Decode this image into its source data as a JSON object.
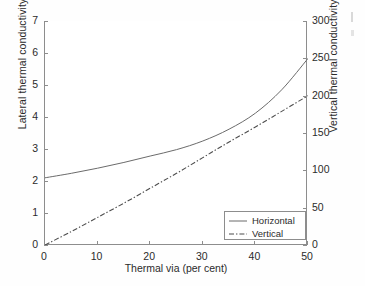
{
  "figure": {
    "kind": "scanned-line-chart",
    "background": "#ffffff",
    "line_color": "#6b6b6b",
    "axis_color": "#8d8d8d",
    "text_color": "#2b2b2b"
  },
  "axes": {
    "x_label": "Thermal via (per cent)",
    "y_left_label": "Lateral thermal conductivity",
    "y_right_label": "Vertical thermal conductivity",
    "x_ticks": [
      "0",
      "10",
      "20",
      "30",
      "40",
      "50"
    ],
    "y_left_ticks": [
      "0",
      "1",
      "2",
      "3",
      "4",
      "5",
      "6",
      "7"
    ],
    "y_right_ticks": [
      "0",
      "50",
      "100",
      "150",
      "200",
      "250",
      "300"
    ]
  },
  "legend": {
    "position": "bottom-right-inside",
    "entries": [
      {
        "label": "Horizontal",
        "style": "solid"
      },
      {
        "label": "Vertical",
        "style": "dash-dot"
      }
    ]
  },
  "chart_data": {
    "type": "line",
    "title": "",
    "xlabel": "Thermal via (per cent)",
    "ylabel": "Lateral thermal conductivity",
    "ylabel_right": "Vertical thermal conductivity",
    "xlim": [
      0,
      50
    ],
    "ylim": [
      0,
      7
    ],
    "ylim_right": [
      0,
      300
    ],
    "xticks": [
      0,
      10,
      20,
      30,
      40,
      50
    ],
    "yticks": [
      0,
      1,
      2,
      3,
      4,
      5,
      6,
      7
    ],
    "yticks_right": [
      0,
      50,
      100,
      150,
      200,
      250,
      300
    ],
    "grid": false,
    "legend_position": "lower right",
    "series": [
      {
        "name": "Horizontal",
        "axis": "left",
        "style": "solid",
        "x": [
          0,
          5,
          10,
          15,
          20,
          25,
          30,
          35,
          40,
          45,
          50
        ],
        "values": [
          2.1,
          2.24,
          2.4,
          2.58,
          2.78,
          2.98,
          3.25,
          3.62,
          4.12,
          4.85,
          5.83
        ]
      },
      {
        "name": "Vertical",
        "axis": "right",
        "style": "dash-dot",
        "x": [
          0,
          5,
          10,
          15,
          20,
          25,
          30,
          35,
          40,
          45,
          50
        ],
        "values": [
          0,
          18,
          37,
          56,
          76,
          96,
          117,
          138,
          158,
          179,
          200
        ]
      }
    ]
  }
}
